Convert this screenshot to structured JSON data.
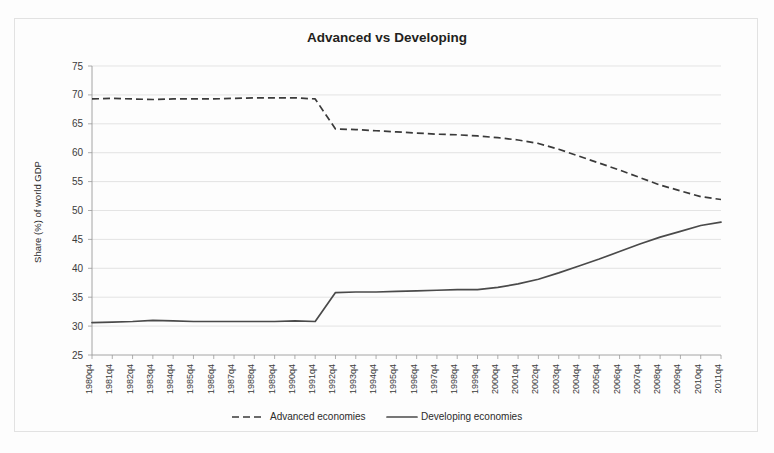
{
  "figure": {
    "title": "Advanced vs Developing"
  },
  "legend": {
    "advanced_label": "Advanced economies",
    "developing_label": "Developing economies"
  },
  "chart_data": {
    "type": "line",
    "title": "Advanced vs Developing",
    "xlabel": "",
    "ylabel": "Share (%) of world GDP",
    "ylim": [
      25,
      75
    ],
    "ytick_values": [
      25,
      30,
      35,
      40,
      45,
      50,
      55,
      60,
      65,
      70,
      75
    ],
    "grid": true,
    "legend_position": "bottom",
    "categories": [
      "1980q4",
      "1981q4",
      "1982q4",
      "1983q4",
      "1984q4",
      "1985q4",
      "1986q4",
      "1987q4",
      "1988q4",
      "1989q4",
      "1990q4",
      "1991q4",
      "1992q4",
      "1993q4",
      "1994q4",
      "1995q4",
      "1996q4",
      "1997q4",
      "1998q4",
      "1999q4",
      "2000q4",
      "2001q4",
      "2002q4",
      "2003q4",
      "2004q4",
      "2005q4",
      "2006q4",
      "2007q4",
      "2008q4",
      "2009q4",
      "2010q4",
      "2011q4"
    ],
    "series": [
      {
        "name": "Advanced economies",
        "style": "dashed",
        "color": "#3a3a3a",
        "values": [
          69.3,
          69.4,
          69.3,
          69.2,
          69.3,
          69.3,
          69.3,
          69.4,
          69.5,
          69.5,
          69.5,
          69.3,
          64.1,
          64.0,
          63.8,
          63.6,
          63.4,
          63.2,
          63.1,
          62.9,
          62.6,
          62.2,
          61.6,
          60.6,
          59.4,
          58.2,
          57.0,
          55.7,
          54.4,
          53.4,
          52.4,
          51.9
        ]
      },
      {
        "name": "Developing economies",
        "style": "solid",
        "color": "#4a4a4a",
        "values": [
          30.6,
          30.7,
          30.8,
          31.0,
          30.9,
          30.8,
          30.8,
          30.8,
          30.8,
          30.8,
          30.9,
          30.8,
          35.8,
          35.9,
          35.9,
          36.0,
          36.1,
          36.2,
          36.3,
          36.3,
          36.7,
          37.3,
          38.1,
          39.2,
          40.4,
          41.6,
          42.9,
          44.2,
          45.4,
          46.4,
          47.4,
          48.0
        ]
      }
    ]
  }
}
